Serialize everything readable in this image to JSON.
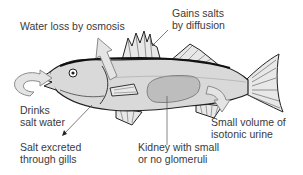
{
  "diagram": {
    "colors": {
      "body": "#d9d9d9",
      "outline": "#222222",
      "arrow_fill": "#e4e4e4",
      "arrow_stroke": "#8a8a8a",
      "kidney": "#bdbdbd",
      "text": "#3a3a3a"
    },
    "labels": {
      "water_loss": "Water loss by osmosis",
      "gains_salts_1": "Gains salts",
      "gains_salts_2": "by diffusion",
      "drinks_1": "Drinks",
      "drinks_2": "salt water",
      "salt_excreted_1": "Salt excreted",
      "salt_excreted_2": "through gills",
      "kidney_1": "Kidney with small",
      "kidney_2": "or no glomeruli",
      "urine_1": "Small volume of",
      "urine_2": "isotonic urine"
    }
  }
}
